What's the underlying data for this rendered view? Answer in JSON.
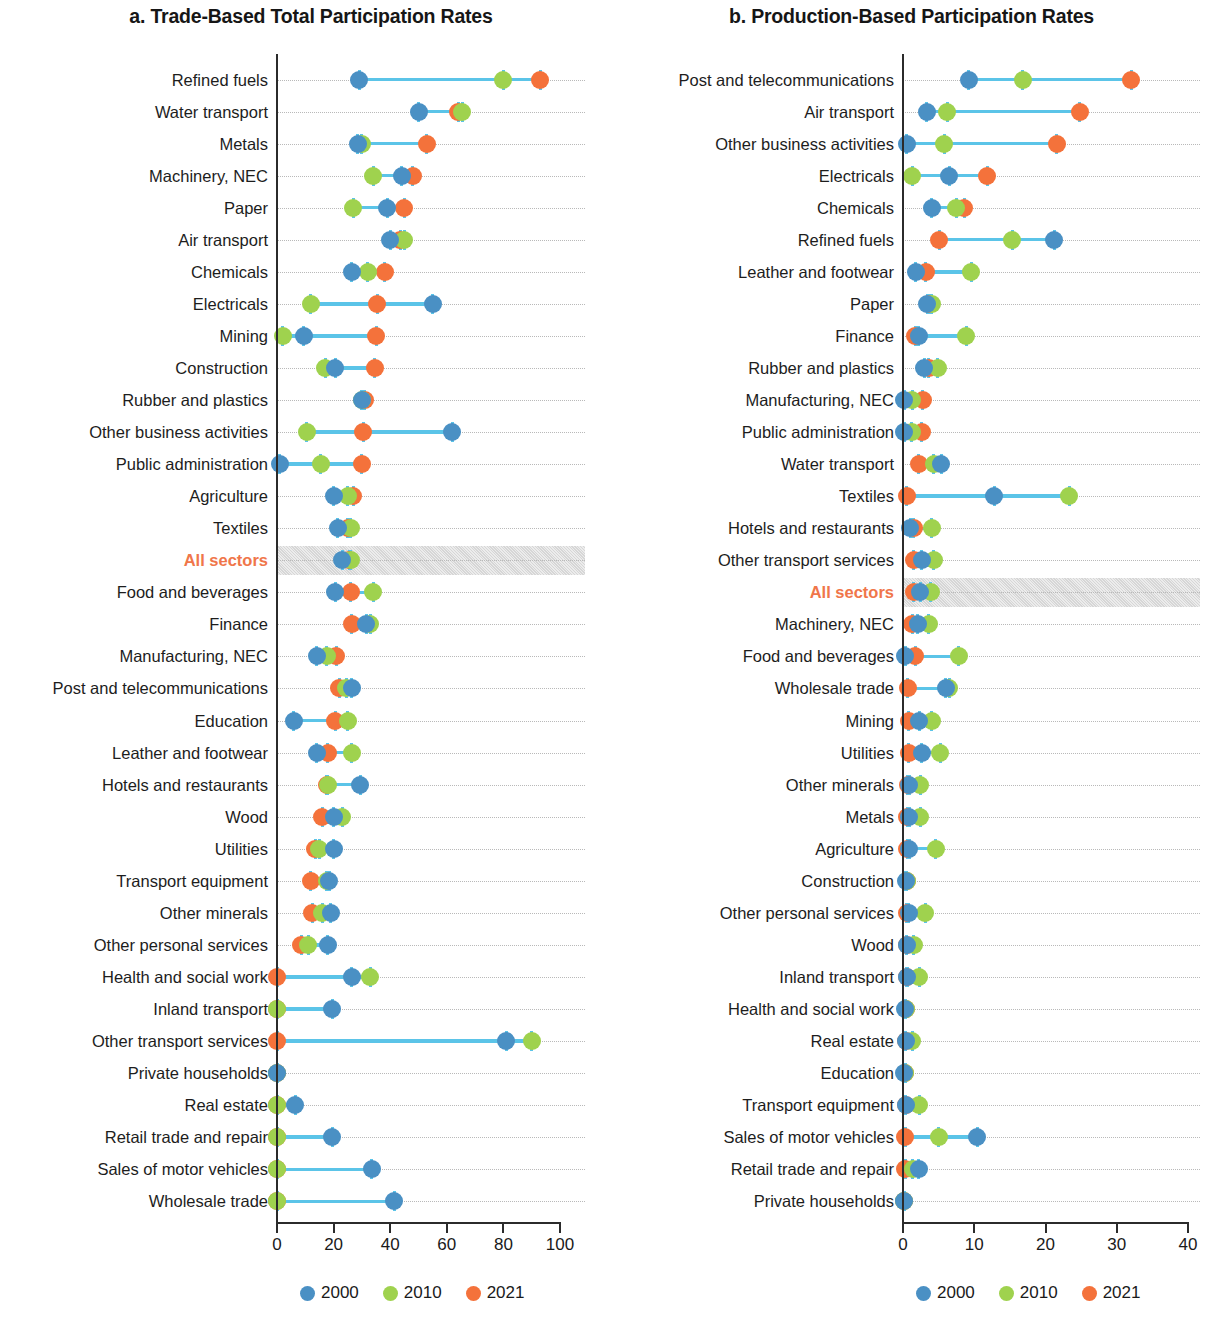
{
  "figure": {
    "panels": [
      {
        "id": "a",
        "title": "a. Trade-Based Total Participation Rates",
        "axis": {
          "min": 0,
          "max": 100,
          "ticks": [
            "0",
            "20",
            "40",
            "60",
            "80",
            "100"
          ],
          "tick_values": [
            0,
            20,
            40,
            60,
            80,
            100
          ]
        },
        "highlight_category": "All sectors"
      },
      {
        "id": "b",
        "title": "b. Production-Based Participation Rates",
        "axis": {
          "min": 0,
          "max": 40,
          "ticks": [
            "0",
            "10",
            "20",
            "30",
            "40"
          ],
          "tick_values": [
            0,
            10,
            20,
            30,
            40
          ]
        },
        "highlight_category": "All sectors"
      }
    ],
    "legend": {
      "position": "bottom-center",
      "entries": [
        {
          "label": "2000",
          "color": "#4a90c4",
          "key": "y2000"
        },
        {
          "label": "2010",
          "color": "#9fd24e",
          "key": "y2010"
        },
        {
          "label": "2021",
          "color": "#f4723b",
          "key": "y2021"
        }
      ]
    }
  },
  "chart_data": [
    {
      "type": "scatter",
      "subtype": "dumbbell",
      "panel": "a",
      "title": "a. Trade-Based Total Participation Rates",
      "xlabel": "",
      "ylabel": "",
      "xlim": [
        0,
        100
      ],
      "xticks": [
        0,
        20,
        40,
        60,
        80,
        100
      ],
      "grid": "horizontal-dotted",
      "legend": [
        "2000",
        "2010",
        "2021"
      ],
      "series": [
        {
          "name": "2000",
          "color": "#4a90c4"
        },
        {
          "name": "2010",
          "color": "#9fd24e"
        },
        {
          "name": "2021",
          "color": "#f4723b"
        }
      ],
      "categories": [
        "Refined fuels",
        "Water transport",
        "Metals",
        "Machinery, NEC",
        "Paper",
        "Air transport",
        "Chemicals",
        "Electricals",
        "Mining",
        "Construction",
        "Rubber and plastics",
        "Other business activities",
        "Public administration",
        "Agriculture",
        "Textiles",
        "All sectors",
        "Food and beverages",
        "Finance",
        "Manufacturing, NEC",
        "Post and telecommunications",
        "Education",
        "Leather and footwear",
        "Hotels and restaurants",
        "Wood",
        "Utilities",
        "Transport equipment",
        "Other minerals",
        "Other personal services",
        "Health and social work",
        "Inland transport",
        "Other transport services",
        "Private households",
        "Real estate",
        "Retail trade and repair",
        "Sales of motor vehicles",
        "Wholesale trade"
      ],
      "points": [
        {
          "category": "Refined fuels",
          "y2000": 29.0,
          "y2010": 80.0,
          "y2021": 93.0
        },
        {
          "category": "Water transport",
          "y2000": 50.0,
          "y2010": 65.5,
          "y2021": 64.0
        },
        {
          "category": "Metals",
          "y2000": 28.5,
          "y2010": 30.0,
          "y2021": 53.0
        },
        {
          "category": "Machinery, NEC",
          "y2000": 44.0,
          "y2010": 34.0,
          "y2021": 48.0
        },
        {
          "category": "Paper",
          "y2000": 39.0,
          "y2010": 27.0,
          "y2021": 45.0
        },
        {
          "category": "Air transport",
          "y2000": 40.0,
          "y2010": 45.0,
          "y2021": 43.5
        },
        {
          "category": "Chemicals",
          "y2000": 26.5,
          "y2010": 32.0,
          "y2021": 38.0
        },
        {
          "category": "Electricals",
          "y2000": 55.0,
          "y2010": 12.0,
          "y2021": 35.5
        },
        {
          "category": "Mining",
          "y2000": 9.5,
          "y2010": 2.0,
          "y2021": 35.0
        },
        {
          "category": "Construction",
          "y2000": 20.5,
          "y2010": 17.0,
          "y2021": 34.5
        },
        {
          "category": "Rubber and plastics",
          "y2000": 30.0,
          "y2010": 30.0,
          "y2021": 31.0
        },
        {
          "category": "Other business activities",
          "y2000": 62.0,
          "y2010": 10.5,
          "y2021": 30.5
        },
        {
          "category": "Public administration",
          "y2000": 1.0,
          "y2010": 15.5,
          "y2021": 30.0
        },
        {
          "category": "Agriculture",
          "y2000": 20.0,
          "y2010": 25.0,
          "y2021": 27.0
        },
        {
          "category": "Textiles",
          "y2000": 21.5,
          "y2010": 26.0,
          "y2021": 25.0
        },
        {
          "category": "All sectors",
          "y2000": 23.0,
          "y2010": 26.0,
          "y2021": 25.5
        },
        {
          "category": "Food and beverages",
          "y2000": 20.5,
          "y2010": 34.0,
          "y2021": 26.0
        },
        {
          "category": "Finance",
          "y2000": 31.5,
          "y2010": 33.0,
          "y2021": 26.5
        },
        {
          "category": "Manufacturing, NEC",
          "y2000": 14.0,
          "y2010": 17.5,
          "y2021": 21.0
        },
        {
          "category": "Post and telecommunications",
          "y2000": 26.5,
          "y2010": 24.5,
          "y2021": 22.0
        },
        {
          "category": "Education",
          "y2000": 6.0,
          "y2010": 25.0,
          "y2021": 20.5
        },
        {
          "category": "Leather and footwear",
          "y2000": 14.0,
          "y2010": 26.5,
          "y2021": 18.0
        },
        {
          "category": "Hotels and restaurants",
          "y2000": 29.5,
          "y2010": 18.0,
          "y2021": 17.5
        },
        {
          "category": "Wood",
          "y2000": 20.0,
          "y2010": 23.0,
          "y2021": 16.0
        },
        {
          "category": "Utilities",
          "y2000": 20.0,
          "y2010": 15.0,
          "y2021": 13.5
        },
        {
          "category": "Transport equipment",
          "y2000": 18.5,
          "y2010": 17.5,
          "y2021": 12.0
        },
        {
          "category": "Other minerals",
          "y2000": 19.0,
          "y2010": 16.0,
          "y2021": 12.5
        },
        {
          "category": "Other personal services",
          "y2000": 18.0,
          "y2010": 11.0,
          "y2021": 8.5
        },
        {
          "category": "Health and social work",
          "y2000": 26.5,
          "y2010": 33.0,
          "y2021": 0.0
        },
        {
          "category": "Inland transport",
          "y2000": 19.5,
          "y2010": 0.0,
          "y2021": 0.0
        },
        {
          "category": "Other transport services",
          "y2000": 81.0,
          "y2010": 90.0,
          "y2021": 0.0
        },
        {
          "category": "Private households",
          "y2000": 0.0,
          "y2010": 0.0,
          "y2021": 0.0
        },
        {
          "category": "Real estate",
          "y2000": 6.5,
          "y2010": 0.0,
          "y2021": 0.0
        },
        {
          "category": "Retail trade and repair",
          "y2000": 19.5,
          "y2010": 0.0,
          "y2021": 0.0
        },
        {
          "category": "Sales of motor vehicles",
          "y2000": 33.5,
          "y2010": 0.0,
          "y2021": 0.0
        },
        {
          "category": "Wholesale trade",
          "y2000": 41.5,
          "y2010": 0.0,
          "y2021": 0.0
        }
      ]
    },
    {
      "type": "scatter",
      "subtype": "dumbbell",
      "panel": "b",
      "title": "b. Production-Based Participation Rates",
      "xlabel": "",
      "ylabel": "",
      "xlim": [
        0,
        40
      ],
      "xticks": [
        0,
        10,
        20,
        30,
        40
      ],
      "grid": "horizontal-dotted",
      "legend": [
        "2000",
        "2010",
        "2021"
      ],
      "series": [
        {
          "name": "2000",
          "color": "#4a90c4"
        },
        {
          "name": "2010",
          "color": "#9fd24e"
        },
        {
          "name": "2021",
          "color": "#f4723b"
        }
      ],
      "categories": [
        "Post and telecommunications",
        "Air transport",
        "Other business activities",
        "Electricals",
        "Chemicals",
        "Refined fuels",
        "Leather and footwear",
        "Paper",
        "Finance",
        "Rubber and plastics",
        "Manufacturing, NEC",
        "Public administration",
        "Water transport",
        "Textiles",
        "Hotels and restaurants",
        "Other transport services",
        "All sectors",
        "Machinery, NEC",
        "Food and beverages",
        "Wholesale trade",
        "Mining",
        "Utilities",
        "Other minerals",
        "Metals",
        "Agriculture",
        "Construction",
        "Other personal services",
        "Wood",
        "Inland transport",
        "Health and social work",
        "Real estate",
        "Education",
        "Transport equipment",
        "Sales of motor vehicles",
        "Retail trade and repair",
        "Private households"
      ],
      "points": [
        {
          "category": "Post and telecommunications",
          "y2000": 9.2,
          "y2010": 16.8,
          "y2021": 32.0
        },
        {
          "category": "Air transport",
          "y2000": 3.3,
          "y2010": 6.2,
          "y2021": 24.8
        },
        {
          "category": "Other business activities",
          "y2000": 0.5,
          "y2010": 5.8,
          "y2021": 21.6
        },
        {
          "category": "Electricals",
          "y2000": 6.5,
          "y2010": 1.3,
          "y2021": 11.8
        },
        {
          "category": "Chemicals",
          "y2000": 4.0,
          "y2010": 7.5,
          "y2021": 8.6
        },
        {
          "category": "Refined fuels",
          "y2000": 21.2,
          "y2010": 15.3,
          "y2021": 5.1
        },
        {
          "category": "Leather and footwear",
          "y2000": 1.8,
          "y2010": 9.6,
          "y2021": 3.2
        },
        {
          "category": "Paper",
          "y2000": 3.4,
          "y2010": 4.0,
          "y2021": 3.6
        },
        {
          "category": "Finance",
          "y2000": 2.2,
          "y2010": 8.9,
          "y2021": 1.7
        },
        {
          "category": "Rubber and plastics",
          "y2000": 3.0,
          "y2010": 4.9,
          "y2021": 3.6
        },
        {
          "category": "Manufacturing, NEC",
          "y2000": 0.2,
          "y2010": 1.3,
          "y2021": 2.8
        },
        {
          "category": "Public administration",
          "y2000": 0.2,
          "y2010": 1.2,
          "y2021": 2.6
        },
        {
          "category": "Water transport",
          "y2000": 5.4,
          "y2010": 4.3,
          "y2021": 2.2
        },
        {
          "category": "Textiles",
          "y2000": 12.8,
          "y2010": 23.3,
          "y2021": 0.5
        },
        {
          "category": "Hotels and restaurants",
          "y2000": 1.0,
          "y2010": 4.0,
          "y2021": 1.5
        },
        {
          "category": "Other transport services",
          "y2000": 2.6,
          "y2010": 4.3,
          "y2021": 1.5
        },
        {
          "category": "All sectors",
          "y2000": 2.4,
          "y2010": 3.9,
          "y2021": 1.5
        },
        {
          "category": "Machinery, NEC",
          "y2000": 2.1,
          "y2010": 3.6,
          "y2021": 1.3
        },
        {
          "category": "Food and beverages",
          "y2000": 0.3,
          "y2010": 7.8,
          "y2021": 1.7
        },
        {
          "category": "Wholesale trade",
          "y2000": 6.0,
          "y2010": 6.5,
          "y2021": 0.7
        },
        {
          "category": "Mining",
          "y2000": 2.3,
          "y2010": 4.0,
          "y2021": 0.8
        },
        {
          "category": "Utilities",
          "y2000": 2.6,
          "y2010": 5.2,
          "y2021": 0.8
        },
        {
          "category": "Other minerals",
          "y2000": 0.9,
          "y2010": 2.4,
          "y2021": 0.7
        },
        {
          "category": "Metals",
          "y2000": 0.9,
          "y2010": 2.4,
          "y2021": 0.6
        },
        {
          "category": "Agriculture",
          "y2000": 0.9,
          "y2010": 4.6,
          "y2021": 0.6
        },
        {
          "category": "Construction",
          "y2000": 0.4,
          "y2010": 0.5,
          "y2021": 0.5
        },
        {
          "category": "Other personal services",
          "y2000": 0.8,
          "y2010": 3.1,
          "y2021": 0.5
        },
        {
          "category": "Wood",
          "y2000": 0.5,
          "y2010": 1.5,
          "y2021": 0.5
        },
        {
          "category": "Inland transport",
          "y2000": 0.6,
          "y2010": 2.3,
          "y2021": 0.5
        },
        {
          "category": "Health and social work",
          "y2000": 0.3,
          "y2010": 0.4,
          "y2021": 0.4
        },
        {
          "category": "Real estate",
          "y2000": 0.4,
          "y2010": 1.3,
          "y2021": 0.4
        },
        {
          "category": "Education",
          "y2000": 0.2,
          "y2010": 0.3,
          "y2021": 0.3
        },
        {
          "category": "Transport equipment",
          "y2000": 0.4,
          "y2010": 2.3,
          "y2021": 0.4
        },
        {
          "category": "Sales of motor vehicles",
          "y2000": 10.4,
          "y2010": 5.0,
          "y2021": 0.3
        },
        {
          "category": "Retail trade and repair",
          "y2000": 2.2,
          "y2010": 1.4,
          "y2021": 0.3
        },
        {
          "category": "Private households",
          "y2000": 0.1,
          "y2010": 0.1,
          "y2021": 0.2
        }
      ]
    }
  ]
}
